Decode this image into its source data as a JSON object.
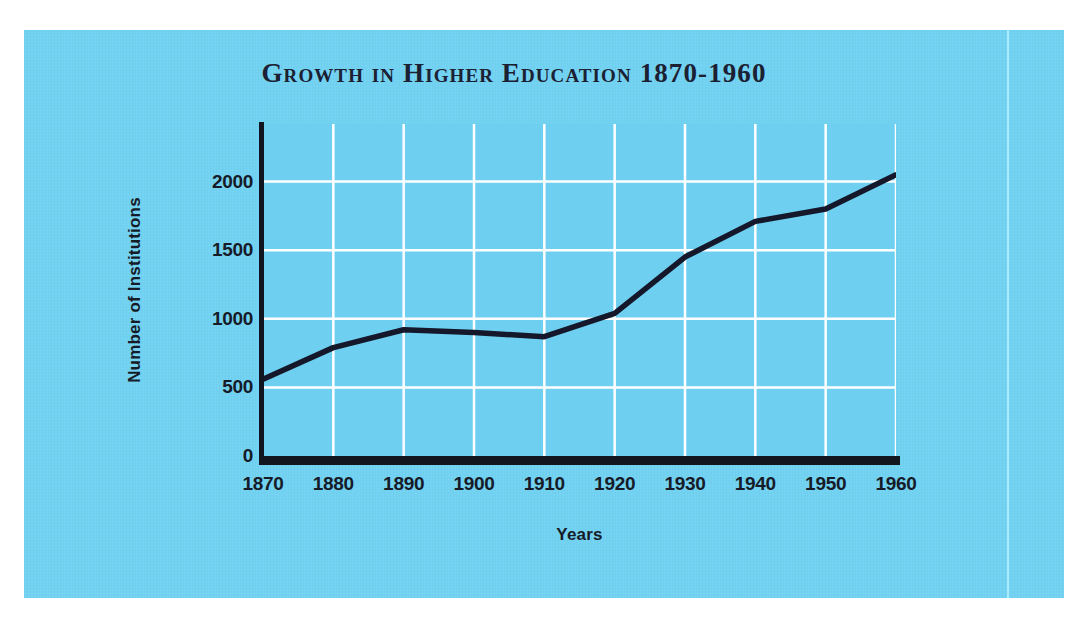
{
  "figure": {
    "panel_color": "#72d2f2",
    "plot_background_color": "#6ecff0",
    "gridline_color": "#ffffff",
    "axis_color": "#12161f",
    "line_color": "#14182a",
    "title_color": "#1b2132",
    "divider_color": "#a9ecfc"
  },
  "chart_data": {
    "type": "line",
    "title": "Growth in Higher Education 1870-1960",
    "xlabel": "Years",
    "ylabel": "Number of Institutions",
    "categories": [
      "1870",
      "1880",
      "1890",
      "1900",
      "1910",
      "1920",
      "1930",
      "1940",
      "1950",
      "1960"
    ],
    "x": [
      1870,
      1880,
      1890,
      1900,
      1910,
      1920,
      1930,
      1940,
      1950,
      1960
    ],
    "values": [
      560,
      790,
      920,
      900,
      870,
      1040,
      1450,
      1710,
      1800,
      2050
    ],
    "series": [
      {
        "name": "Number of Institutions",
        "values": [
          560,
          790,
          920,
          900,
          870,
          1040,
          1450,
          1710,
          1800,
          2050
        ]
      }
    ],
    "xlim": [
      1870,
      1960
    ],
    "ylim": [
      0,
      2420
    ],
    "ytick_labels": [
      "0",
      "500",
      "1000",
      "1500",
      "2000"
    ],
    "yticks": [
      0,
      500,
      1000,
      1500,
      2000
    ],
    "xtick_labels": [
      "1870",
      "1880",
      "1890",
      "1900",
      "1910",
      "1920",
      "1930",
      "1940",
      "1950",
      "1960"
    ],
    "grid": true,
    "grid_axis": "both",
    "legend": false,
    "legend_position": "none"
  }
}
